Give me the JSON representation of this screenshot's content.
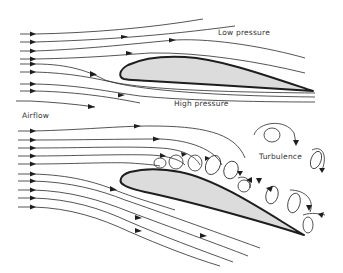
{
  "diagram": {
    "colors": {
      "background": "#ffffff",
      "airfoil_fill": "#dcdcdc",
      "airfoil_outline": "#1e1e1e",
      "streamline": "#2a2a2a",
      "text": "#333333"
    },
    "panels": [
      {
        "id": "normal-flow",
        "description": "Airfoil at low angle of attack with smooth laminar streamlines",
        "labels": {
          "upper": "Low pressure",
          "lower": "High pressure"
        }
      },
      {
        "id": "stalled-flow",
        "description": "Airfoil at high angle of attack with separated turbulent flow above",
        "labels": {
          "turbulence": "Turbulence"
        }
      }
    ],
    "labels": {
      "airflow": "Airflow",
      "low_pressure": "Low pressure",
      "high_pressure": "High pressure",
      "turbulence": "Turbulence"
    }
  }
}
